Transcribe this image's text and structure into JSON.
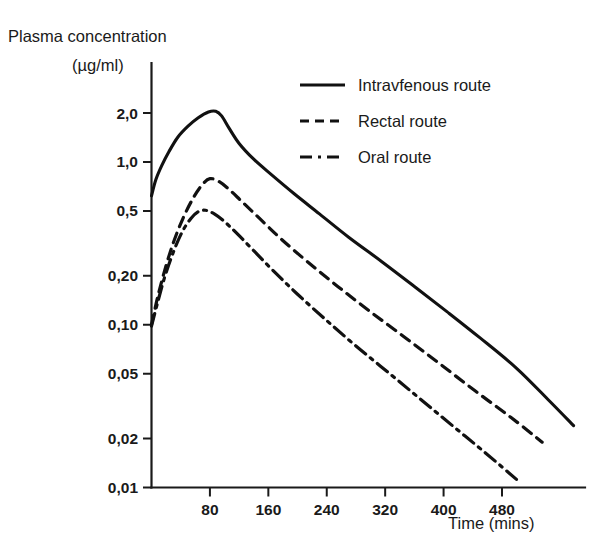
{
  "chart_data": {
    "type": "line",
    "title": "",
    "ylabel": "Plasma concentration",
    "yunit": "(µg/ml)",
    "xlabel": "Time (mins)",
    "yscale": "log",
    "ylim": [
      0.01,
      2.6
    ],
    "xlim": [
      0,
      545
    ],
    "grid": false,
    "legend_position": "top-right",
    "ytick_labels": [
      "2,0",
      "1,0",
      "0,5",
      "0,20",
      "0,10",
      "0,05",
      "0,02",
      "0,01"
    ],
    "ytick_values": [
      2.0,
      1.0,
      0.5,
      0.2,
      0.1,
      0.05,
      0.02,
      0.01
    ],
    "xtick_labels": [
      "80",
      "160",
      "240",
      "320",
      "400",
      "480"
    ],
    "xtick_values": [
      80,
      160,
      240,
      320,
      400,
      480
    ],
    "series": [
      {
        "name": "Intravfenous route",
        "style": "solid",
        "color": "#111111",
        "x": [
          0,
          6,
          14,
          24,
          36,
          50,
          64,
          78,
          88,
          96,
          106,
          120,
          140,
          165,
          195,
          230,
          270,
          315,
          360,
          405,
          450,
          500,
          545,
          578
        ],
        "y": [
          0.62,
          0.78,
          0.95,
          1.16,
          1.42,
          1.66,
          1.87,
          2.03,
          2.05,
          1.92,
          1.62,
          1.3,
          1.04,
          0.83,
          0.64,
          0.48,
          0.345,
          0.245,
          0.172,
          0.12,
          0.083,
          0.054,
          0.034,
          0.024
        ]
      },
      {
        "name": "Rectal route",
        "style": "dashed",
        "color": "#111111",
        "x": [
          0,
          8,
          18,
          30,
          44,
          58,
          70,
          80,
          92,
          106,
          124,
          148,
          178,
          214,
          255,
          300,
          348,
          396,
          444,
          492,
          535
        ],
        "y": [
          0.1,
          0.145,
          0.215,
          0.32,
          0.46,
          0.61,
          0.73,
          0.79,
          0.76,
          0.68,
          0.57,
          0.45,
          0.335,
          0.243,
          0.172,
          0.12,
          0.083,
          0.057,
          0.039,
          0.027,
          0.019
        ]
      },
      {
        "name": "Oral route",
        "style": "dashdot",
        "color": "#111111",
        "x": [
          0,
          8,
          18,
          30,
          42,
          54,
          64,
          74,
          86,
          100,
          118,
          140,
          168,
          200,
          238,
          280,
          324,
          368,
          412,
          456,
          500
        ],
        "y": [
          0.098,
          0.135,
          0.196,
          0.28,
          0.372,
          0.45,
          0.495,
          0.505,
          0.48,
          0.43,
          0.36,
          0.285,
          0.212,
          0.154,
          0.108,
          0.074,
          0.051,
          0.035,
          0.024,
          0.0165,
          0.0112
        ]
      }
    ],
    "legend": [
      {
        "label": "Intravfenous route",
        "style": "solid"
      },
      {
        "label": "Rectal route",
        "style": "dashed"
      },
      {
        "label": "Oral route",
        "style": "dashdot"
      }
    ]
  }
}
